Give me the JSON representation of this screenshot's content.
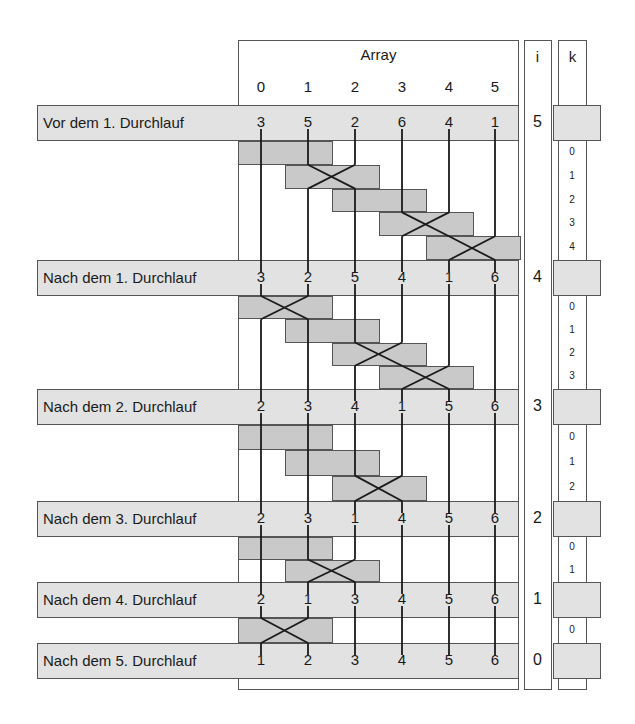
{
  "header": {
    "array_title": "Array",
    "i_title": "i",
    "k_title": "k",
    "indices": [
      "0",
      "1",
      "2",
      "3",
      "4",
      "5"
    ]
  },
  "rows": [
    {
      "label": "Vor dem 1. Durchlauf",
      "values": [
        "3",
        "5",
        "2",
        "6",
        "4",
        "1"
      ],
      "i": "5"
    },
    {
      "label": "Nach dem 1. Durchlauf",
      "values": [
        "3",
        "2",
        "5",
        "4",
        "1",
        "6"
      ],
      "i": "4"
    },
    {
      "label": "Nach dem 2. Durchlauf",
      "values": [
        "2",
        "3",
        "4",
        "1",
        "5",
        "6"
      ],
      "i": "3"
    },
    {
      "label": "Nach dem 3. Durchlauf",
      "values": [
        "2",
        "3",
        "1",
        "4",
        "5",
        "6"
      ],
      "i": "2"
    },
    {
      "label": "Nach dem 4. Durchlauf",
      "values": [
        "2",
        "1",
        "3",
        "4",
        "5",
        "6"
      ],
      "i": "1"
    },
    {
      "label": "Nach dem 5. Durchlauf",
      "values": [
        "1",
        "2",
        "3",
        "4",
        "5",
        "6"
      ],
      "i": "0"
    }
  ],
  "passes": [
    {
      "k": [
        "0",
        "1",
        "2",
        "3",
        "4"
      ],
      "swaps": [
        false,
        true,
        false,
        true,
        true
      ]
    },
    {
      "k": [
        "0",
        "1",
        "2",
        "3"
      ],
      "swaps": [
        true,
        false,
        true,
        true
      ]
    },
    {
      "k": [
        "0",
        "1",
        "2"
      ],
      "swaps": [
        false,
        false,
        true
      ]
    },
    {
      "k": [
        "0",
        "1"
      ],
      "swaps": [
        false,
        true
      ]
    },
    {
      "k": [
        "0"
      ],
      "swaps": [
        true
      ]
    }
  ],
  "colors": {
    "band": "#e2e2e2",
    "compare_box": "#c9c9c9",
    "line": "#1a1a1a",
    "border": "#555555"
  }
}
